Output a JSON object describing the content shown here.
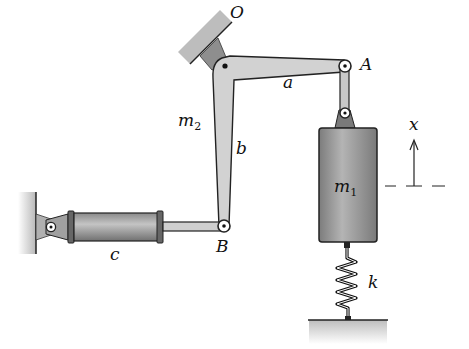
{
  "diagram": {
    "type": "mechanism",
    "labels": {
      "pivot_O": "O",
      "joint_A": "A",
      "joint_B": "B",
      "arm_a": "a",
      "arm_b": "b",
      "mass_2_base": "m",
      "mass_2_sub": "2",
      "mass_1_base": "m",
      "mass_1_sub": "1",
      "cylinder_c": "c",
      "spring_k": "k",
      "displacement_x": "x"
    },
    "colors": {
      "link_fill": "#d4d4d4",
      "mass_fill": "#9a9a9a",
      "cylinder_fill": "#a8a8a8",
      "ground_fill": "#cfcfcf",
      "stroke": "#222222"
    }
  }
}
